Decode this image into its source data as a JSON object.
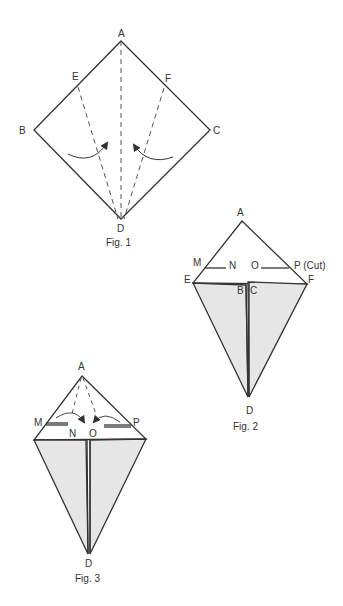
{
  "colors": {
    "line": "#333333",
    "fill": "#e6e6e6",
    "background": "#ffffff"
  },
  "fig1": {
    "caption": "Fig. 1",
    "labels": {
      "A": "A",
      "B": "B",
      "C": "C",
      "D": "D",
      "E": "E",
      "F": "F"
    }
  },
  "fig2": {
    "caption": "Fig. 2",
    "labels": {
      "A": "A",
      "M": "M",
      "N": "N",
      "O": "O",
      "P": "P (Cut)",
      "E": "E",
      "F": "F",
      "B": "B",
      "C": "C",
      "D": "D"
    }
  },
  "fig3": {
    "caption": "Fig. 3",
    "labels": {
      "A": "A",
      "M": "M",
      "N": "N",
      "O": "O",
      "P": "P",
      "D": "D"
    }
  }
}
